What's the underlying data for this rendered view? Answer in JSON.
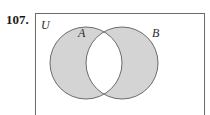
{
  "problem": {
    "number": "107."
  },
  "diagram": {
    "type": "venn",
    "universe_label": "U",
    "sets": [
      {
        "label": "A",
        "cx": 86,
        "cy": 63,
        "r": 36
      },
      {
        "label": "B",
        "cx": 122,
        "cy": 63,
        "r": 36
      }
    ],
    "shaded_region": "symmetric difference (A ∪ B) − (A ∩ B)",
    "colors": {
      "shade": "#d4d4d4",
      "stroke": "#6b6b6b",
      "frame": "#6b6b6b",
      "background": "#ffffff"
    }
  }
}
